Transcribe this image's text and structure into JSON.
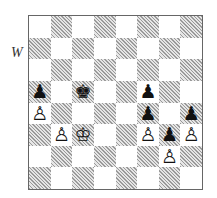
{
  "side_to_move_label": "W",
  "board": {
    "orientation": "white-bottom",
    "files": [
      "a",
      "b",
      "c",
      "d",
      "e",
      "f",
      "g",
      "h"
    ],
    "ranks": [
      8,
      7,
      6,
      5,
      4,
      3,
      2,
      1
    ],
    "pieces": [
      {
        "square": "a5",
        "color": "black",
        "type": "pawn",
        "glyph": "♟"
      },
      {
        "square": "c5",
        "color": "black",
        "type": "king",
        "glyph": "♚"
      },
      {
        "square": "f5",
        "color": "black",
        "type": "pawn",
        "glyph": "♟"
      },
      {
        "square": "a4",
        "color": "white",
        "type": "pawn",
        "glyph": "♙"
      },
      {
        "square": "f4",
        "color": "black",
        "type": "pawn",
        "glyph": "♟"
      },
      {
        "square": "h4",
        "color": "black",
        "type": "pawn",
        "glyph": "♟"
      },
      {
        "square": "b3",
        "color": "white",
        "type": "pawn",
        "glyph": "♙"
      },
      {
        "square": "c3",
        "color": "white",
        "type": "king",
        "glyph": "♔"
      },
      {
        "square": "f3",
        "color": "white",
        "type": "pawn",
        "glyph": "♙"
      },
      {
        "square": "g3",
        "color": "black",
        "type": "pawn",
        "glyph": "♟"
      },
      {
        "square": "h3",
        "color": "white",
        "type": "pawn",
        "glyph": "♙"
      },
      {
        "square": "g2",
        "color": "white",
        "type": "pawn",
        "glyph": "♙"
      }
    ]
  }
}
